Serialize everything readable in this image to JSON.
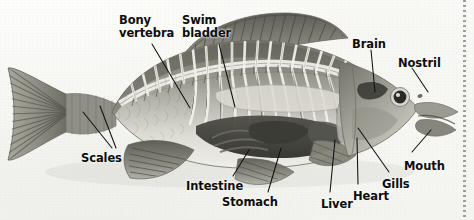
{
  "figure": {
    "medium": "scanned textbook illustration",
    "background_color": "#fafaf7",
    "label_color": "#0d0d0d",
    "leader_line_color": "#111111",
    "fish_body_color": "#9a9a90",
    "fish_belly_color": "#e9e9e2",
    "fish_dark_color": "#4a4a44",
    "fish_fin_color": "#7d7d74"
  },
  "labels": [
    {
      "id": "bony-vertebra",
      "line1": "Bony",
      "line2": "vertebra",
      "x": 119,
      "y": 14
    },
    {
      "id": "swim-bladder",
      "line1": "Swim",
      "line2": "bladder",
      "x": 182,
      "y": 14
    },
    {
      "id": "brain",
      "line1": "Brain",
      "line2": "",
      "x": 352,
      "y": 38
    },
    {
      "id": "nostril",
      "line1": "Nostril",
      "line2": "",
      "x": 398,
      "y": 57
    },
    {
      "id": "scales",
      "line1": "Scales",
      "line2": "",
      "x": 81,
      "y": 152
    },
    {
      "id": "intestine",
      "line1": "Intestine",
      "line2": "",
      "x": 186,
      "y": 180
    },
    {
      "id": "stomach",
      "line1": "Stomach",
      "line2": "",
      "x": 222,
      "y": 196
    },
    {
      "id": "liver",
      "line1": "Liver",
      "line2": "",
      "x": 321,
      "y": 198
    },
    {
      "id": "heart",
      "line1": "Heart",
      "line2": "",
      "x": 353,
      "y": 190
    },
    {
      "id": "gills",
      "line1": "Gills",
      "line2": "",
      "x": 382,
      "y": 178
    },
    {
      "id": "mouth",
      "line1": "Mouth",
      "line2": "",
      "x": 404,
      "y": 160
    }
  ],
  "leader_lines": [
    {
      "id": "leader-bony-vertebra",
      "from": [
        152,
        44
      ],
      "to": [
        190,
        108
      ]
    },
    {
      "id": "leader-swim-bladder",
      "from": [
        219,
        44
      ],
      "to": [
        235,
        107
      ]
    },
    {
      "id": "leader-brain",
      "from": [
        371,
        50
      ],
      "to": [
        375,
        92
      ]
    },
    {
      "id": "leader-nostril",
      "from": [
        412,
        68
      ],
      "to": [
        428,
        92
      ]
    },
    {
      "id": "leader-scales-a",
      "from": [
        112,
        148
      ],
      "to": [
        83,
        112
      ]
    },
    {
      "id": "leader-scales-b",
      "from": [
        116,
        148
      ],
      "to": [
        100,
        106
      ]
    },
    {
      "id": "leader-intestine",
      "from": [
        233,
        176
      ],
      "to": [
        249,
        150
      ]
    },
    {
      "id": "leader-stomach",
      "from": [
        268,
        192
      ],
      "to": [
        281,
        148
      ]
    },
    {
      "id": "leader-liver",
      "from": [
        330,
        192
      ],
      "to": [
        335,
        140
      ]
    },
    {
      "id": "leader-heart",
      "from": [
        358,
        184
      ],
      "to": [
        357,
        138
      ]
    },
    {
      "id": "leader-gills",
      "from": [
        389,
        172
      ],
      "to": [
        358,
        128
      ]
    },
    {
      "id": "leader-mouth",
      "from": [
        412,
        152
      ],
      "to": [
        431,
        130
      ]
    }
  ]
}
